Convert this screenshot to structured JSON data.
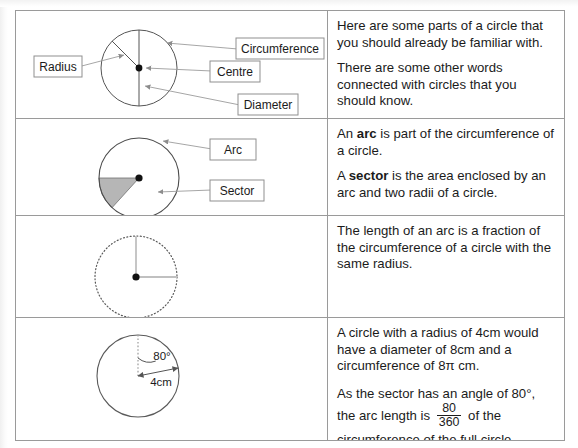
{
  "document": {
    "title": "Parts of a Circle — reference table",
    "border_color": "#9a9a9a",
    "text_color": "#1b1b1b",
    "sector_fill_color": "#b6b6b6",
    "guide_color": "#bdbdbd"
  },
  "rows": [
    {
      "id": "row-parts-of-a-circle",
      "diagram": {
        "name": "circle-parts-diagram",
        "labels": [
          {
            "name": "label-radius",
            "text": "Radius"
          },
          {
            "name": "label-circumference",
            "text": "Circumference"
          },
          {
            "name": "label-centre",
            "text": "Centre"
          },
          {
            "name": "label-diameter",
            "text": "Diameter"
          }
        ]
      },
      "paragraphs": [
        {
          "id": "p1",
          "text": "Here are some parts of a circle that you should already be familiar with."
        },
        {
          "id": "p2",
          "text": "There are some other words connected with circles that you should know."
        }
      ]
    },
    {
      "id": "row-arc-and-sector",
      "diagram": {
        "name": "arc-sector-diagram",
        "labels": [
          {
            "name": "label-arc",
            "text": "Arc"
          },
          {
            "name": "label-sector",
            "text": "Sector"
          }
        ]
      },
      "paragraphs": [
        {
          "id": "p3",
          "prefix": "An ",
          "bold": "arc",
          "suffix": " is part of the circumference of a circle."
        },
        {
          "id": "p4",
          "prefix": "A ",
          "bold": "sector",
          "suffix": " is the area enclosed by an arc and two radii of a circle."
        }
      ]
    },
    {
      "id": "row-arc-length-fraction",
      "diagram": {
        "name": "dotted-circle-diagram",
        "labels": []
      },
      "paragraphs": [
        {
          "id": "p5",
          "text": "The length of an arc is a fraction of the circumference of a circle with the same radius."
        }
      ]
    },
    {
      "id": "row-worked-example",
      "diagram": {
        "name": "eighty-degree-sector-diagram",
        "labels": [
          {
            "name": "label-angle-80",
            "text": "80°"
          },
          {
            "name": "label-radius-4cm",
            "text": "4cm"
          }
        ]
      },
      "paragraphs": [
        {
          "id": "p6",
          "text": "A circle with a radius of 4cm would have a diameter of 8cm and a circumference of 8π cm."
        },
        {
          "id": "p7",
          "part_a": "As the sector has an angle of 80°, the arc length is ",
          "fraction_numerator": "80",
          "fraction_denominator": "360",
          "part_b": " of the circumference of the full circle."
        }
      ]
    }
  ]
}
